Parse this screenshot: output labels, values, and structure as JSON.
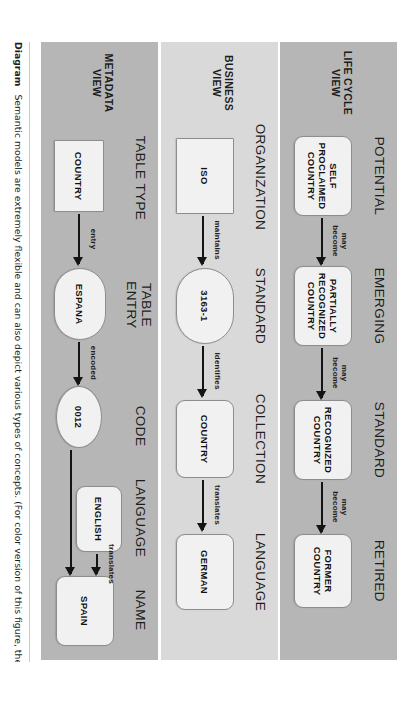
{
  "figure": {
    "caption_label": "Diagram",
    "caption_text": "Semantic models are extremely flexible and can also depict various types of concepts. (For color version of this figure, the reader"
  },
  "bands": [
    {
      "name": "LIFE CYCLE\nVIEW",
      "stages": [
        "POTENTIAL",
        "EMERGING",
        "STANDARD",
        "RETIRED"
      ],
      "nodes": [
        {
          "label": "SELF\nPROCLAIMED\nCOUNTRY",
          "shape": "round"
        },
        {
          "label": "PARTIALLY\nRECOGNIZED\nCOUNTRY",
          "shape": "round"
        },
        {
          "label": "RECOGNIZED\nCOUNTRY",
          "shape": "round"
        },
        {
          "label": "FORMER\nCOUNTRY",
          "shape": "round"
        }
      ],
      "arrows": [
        {
          "label": "may\nbecome"
        },
        {
          "label": "may\nbecome"
        },
        {
          "label": "may\nbecome"
        }
      ]
    },
    {
      "name": "BUSINESS\nVIEW",
      "stages": [
        "ORGANIZATION",
        "STANDARD",
        "COLLECTION",
        "LANGUAGE"
      ],
      "nodes": [
        {
          "label": "ISO",
          "shape": "rect"
        },
        {
          "label": "3163-1",
          "shape": "stadium"
        },
        {
          "label": "COUNTRY",
          "shape": "round"
        },
        {
          "label": "GERMAN",
          "shape": "round"
        }
      ],
      "arrows": [
        {
          "label": "maintains"
        },
        {
          "label": "identifies"
        },
        {
          "label": "translates"
        }
      ]
    },
    {
      "name": "METADATA\nVIEW",
      "stages": [
        "TABLE TYPE",
        "TABLE\nENTRY",
        "CODE",
        "LANGUAGE",
        "NAME"
      ],
      "nodes": [
        {
          "label": "COUNTRY",
          "shape": "rect"
        },
        {
          "label": "ESPANA",
          "shape": "stadium"
        },
        {
          "label": "0012",
          "shape": "ellipse"
        },
        {
          "label": "ENGLISH",
          "shape": "round"
        },
        {
          "label": "SPAIN",
          "shape": "round"
        }
      ],
      "arrows": [
        {
          "label": "entry"
        },
        {
          "label": "encoded"
        },
        {
          "label": "translates"
        },
        {
          "label": ""
        }
      ]
    }
  ],
  "colors": {
    "band_dark": "#b6b6b6",
    "band_light": "#d9d9d9",
    "node_fill": "#f1f1f1",
    "node_stroke": "#8d8d8d",
    "arrow": "#141414",
    "page": "#ffffff"
  }
}
